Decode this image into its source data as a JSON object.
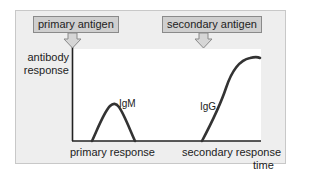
{
  "diagram": {
    "antigens": {
      "primary": "primary antigen",
      "secondary": "secondary antigen"
    },
    "axes": {
      "y_label_line1": "antibody",
      "y_label_line2": "response",
      "x_label": "time"
    },
    "phases": {
      "primary": "primary response",
      "secondary": "secondary response"
    },
    "curves": {
      "igm": "IgM",
      "igg": "IgG"
    },
    "colors": {
      "panel_bg": "#eeeeee",
      "plot_bg": "#ffffff",
      "antigen_box": "#cfcfcf",
      "line": "#333333"
    }
  }
}
